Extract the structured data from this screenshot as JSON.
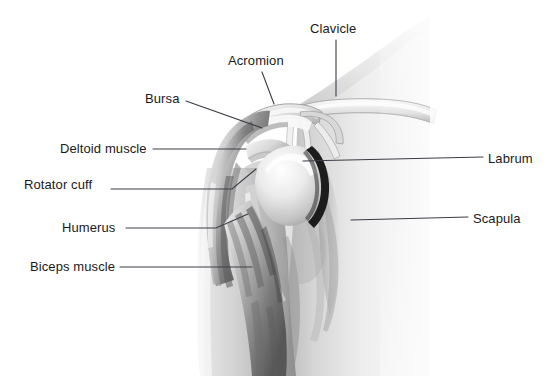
{
  "figure": {
    "background_color": "#ffffff",
    "leader_line_color": "#3c3c46",
    "label_text_color": "#1a1a1a",
    "skin_light": "#f2f2f2",
    "skin_mid": "#d4d4d4",
    "skin_shadow": "#9a9a9a",
    "muscle_dark": "#6e6e6e",
    "bone_light": "#fbfbfb",
    "labrum_dark": "#1c1c1c"
  },
  "labels": [
    {
      "id": "bursa",
      "text": "Bursa",
      "side": "left",
      "text_x": 145,
      "text_y": 92,
      "leader": "M 186 101 L 262 128"
    },
    {
      "id": "deltoid-muscle",
      "text": "Deltoid muscle",
      "side": "left",
      "text_x": 60,
      "text_y": 142,
      "leader": "M 153 149 L 246 149"
    },
    {
      "id": "rotator-cuff",
      "text": "Rotator cuff",
      "side": "left",
      "text_x": 24,
      "text_y": 178,
      "leader": "M 111 189 L 232 189 L 256 169"
    },
    {
      "id": "humerus",
      "text": "Humerus",
      "side": "left",
      "text_x": 62,
      "text_y": 221,
      "leader": "M 126 228 L 216 228 L 248 214"
    },
    {
      "id": "biceps-muscle",
      "text": "Biceps muscle",
      "side": "left",
      "text_x": 30,
      "text_y": 260,
      "leader": "M 120 267 L 252 267"
    },
    {
      "id": "acromion",
      "text": "Acromion",
      "side": "left",
      "text_x": 228,
      "text_y": 54,
      "leader": "M 262 72 L 274 104"
    },
    {
      "id": "clavicle",
      "text": "Clavicle",
      "side": "left",
      "text_x": 310,
      "text_y": 22,
      "leader": "M 336 40 L 336 96"
    },
    {
      "id": "labrum",
      "text": "Labrum",
      "side": "right",
      "text_x": 488,
      "text_y": 152,
      "leader": "M 303 161 L 483 157"
    },
    {
      "id": "scapula",
      "text": "Scapula",
      "side": "right",
      "text_x": 473,
      "text_y": 212,
      "leader": "M 351 220 L 468 217"
    }
  ]
}
